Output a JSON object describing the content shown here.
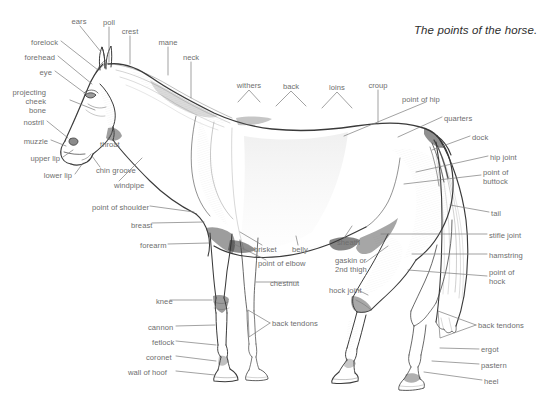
{
  "canvas": {
    "width": 544,
    "height": 405,
    "background": "#ffffff"
  },
  "title": {
    "text": "The points of the horse.",
    "color": "#2e2e2e"
  },
  "style": {
    "label_color": "#6e6e6e",
    "leader_color": "#7a7a7a",
    "ink_color": "#3a3a3a"
  },
  "labels": [
    {
      "id": "ears",
      "text": "ears",
      "x": 79,
      "y": 21,
      "align": "center"
    },
    {
      "id": "poll",
      "text": "poll",
      "x": 108,
      "y": 22,
      "align": "center"
    },
    {
      "id": "crest",
      "text": "crest",
      "x": 129,
      "y": 31,
      "align": "center"
    },
    {
      "id": "mane",
      "text": "mane",
      "x": 168,
      "y": 42,
      "align": "center"
    },
    {
      "id": "neck",
      "text": "neck",
      "x": 191,
      "y": 57,
      "align": "center"
    },
    {
      "id": "forelock",
      "text": "forelock",
      "x": 58,
      "y": 42,
      "align": "right"
    },
    {
      "id": "forehead",
      "text": "forehead",
      "x": 55,
      "y": 57,
      "align": "right"
    },
    {
      "id": "eye",
      "text": "eye",
      "x": 52,
      "y": 72,
      "align": "right"
    },
    {
      "id": "projecting-cheek-bone",
      "text": "projecting cheek bone",
      "x": 46,
      "y": 86,
      "align": "right",
      "lines": [
        "projecting",
        "cheek",
        "bone"
      ]
    },
    {
      "id": "nostril",
      "text": "nostril",
      "x": 44,
      "y": 122,
      "align": "right"
    },
    {
      "id": "muzzle",
      "text": "muzzle",
      "x": 48,
      "y": 141,
      "align": "right"
    },
    {
      "id": "upper-lip",
      "text": "upper lip",
      "x": 60,
      "y": 158,
      "align": "right"
    },
    {
      "id": "lower-lip",
      "text": "lower lip",
      "x": 72,
      "y": 175,
      "align": "right"
    },
    {
      "id": "chin-groove",
      "text": "chin groove",
      "x": 95,
      "y": 170,
      "align": "left"
    },
    {
      "id": "throat",
      "text": "throat",
      "x": 100,
      "y": 144,
      "align": "left"
    },
    {
      "id": "windpipe",
      "text": "windpipe",
      "x": 113,
      "y": 185,
      "align": "left"
    },
    {
      "id": "point-of-shoulder",
      "text": "point of shoulder",
      "x": 92,
      "y": 207,
      "align": "left"
    },
    {
      "id": "breast",
      "text": "breast",
      "x": 131,
      "y": 225,
      "align": "left"
    },
    {
      "id": "forearm",
      "text": "forearm",
      "x": 140,
      "y": 245,
      "align": "left"
    },
    {
      "id": "knee",
      "text": "knee",
      "x": 156,
      "y": 301,
      "align": "left"
    },
    {
      "id": "cannon",
      "text": "cannon",
      "x": 148,
      "y": 327,
      "align": "left"
    },
    {
      "id": "fetlock",
      "text": "fetlock",
      "x": 152,
      "y": 342,
      "align": "left"
    },
    {
      "id": "coronet",
      "text": "coronet",
      "x": 146,
      "y": 357,
      "align": "left"
    },
    {
      "id": "wall-of-hoof",
      "text": "wall of hoof",
      "x": 128,
      "y": 372,
      "align": "left"
    },
    {
      "id": "withers",
      "text": "withers",
      "x": 249,
      "y": 85,
      "align": "center"
    },
    {
      "id": "back",
      "text": "back",
      "x": 291,
      "y": 86,
      "align": "center"
    },
    {
      "id": "loins",
      "text": "loins",
      "x": 337,
      "y": 87,
      "align": "center"
    },
    {
      "id": "croup",
      "text": "croup",
      "x": 378,
      "y": 85,
      "align": "center"
    },
    {
      "id": "point-of-hip",
      "text": "point of hip",
      "x": 428,
      "y": 99,
      "align": "left"
    },
    {
      "id": "quarters",
      "text": "quarters",
      "x": 444,
      "y": 118,
      "align": "left"
    },
    {
      "id": "dock",
      "text": "dock",
      "x": 472,
      "y": 137,
      "align": "left"
    },
    {
      "id": "hip-joint",
      "text": "hip joint",
      "x": 490,
      "y": 157,
      "align": "left"
    },
    {
      "id": "point-of-buttock",
      "text": "point of buttock",
      "x": 483,
      "y": 172,
      "align": "left",
      "lines": [
        "point of",
        "buttock"
      ]
    },
    {
      "id": "tail",
      "text": "tail",
      "x": 491,
      "y": 213,
      "align": "left"
    },
    {
      "id": "stifle-joint",
      "text": "stifle joint",
      "x": 489,
      "y": 235,
      "align": "left"
    },
    {
      "id": "hamstring",
      "text": "hamstring",
      "x": 489,
      "y": 255,
      "align": "left"
    },
    {
      "id": "point-of-hock",
      "text": "point of hock",
      "x": 489,
      "y": 272,
      "align": "left",
      "lines": [
        "point of",
        "hock"
      ]
    },
    {
      "id": "back-tendons-right",
      "text": "back tendons",
      "x": 478,
      "y": 325,
      "align": "left"
    },
    {
      "id": "ergot",
      "text": "ergot",
      "x": 481,
      "y": 349,
      "align": "left"
    },
    {
      "id": "pastern",
      "text": "pastern",
      "x": 481,
      "y": 365,
      "align": "left"
    },
    {
      "id": "heel",
      "text": "heel",
      "x": 484,
      "y": 381,
      "align": "left"
    },
    {
      "id": "brisket",
      "text": "brisket",
      "x": 254,
      "y": 249,
      "align": "left"
    },
    {
      "id": "belly",
      "text": "belly",
      "x": 292,
      "y": 249,
      "align": "left"
    },
    {
      "id": "point-of-elbow",
      "text": "point of elbow",
      "x": 258,
      "y": 263,
      "align": "left"
    },
    {
      "id": "chestnut",
      "text": "chestnut",
      "x": 270,
      "y": 283,
      "align": "left"
    },
    {
      "id": "sheath",
      "text": "sheath",
      "x": 337,
      "y": 242,
      "align": "left"
    },
    {
      "id": "gaskin-or-2nd-thigh",
      "text": "gaskin or 2nd thigh",
      "x": 335,
      "y": 261,
      "align": "left",
      "lines": [
        "gaskin or",
        "2nd thigh"
      ]
    },
    {
      "id": "hock-joint",
      "text": "hock joint",
      "x": 329,
      "y": 290,
      "align": "left"
    },
    {
      "id": "back-tendons-left",
      "text": "back tendons",
      "x": 272,
      "y": 323,
      "align": "left"
    }
  ]
}
